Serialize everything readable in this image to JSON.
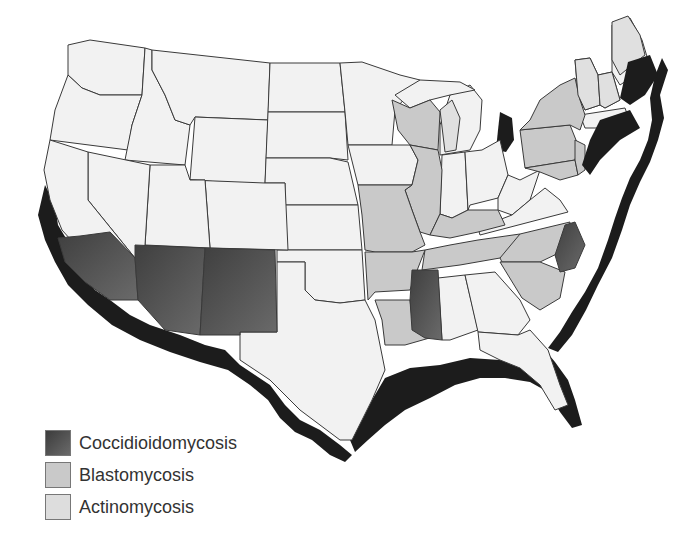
{
  "map": {
    "title": "",
    "region": "Contiguous United States",
    "colors": {
      "background": "#ffffff",
      "default_state": "#f2f2f2",
      "coccidioidomycosis": "#555555",
      "blastomycosis": "#c9c9c9",
      "actinomycosis": "#e0e0e0",
      "coastal_band": "#1a1a1a",
      "border": "#3a3a3a"
    },
    "states": {
      "coccidioidomycosis": [
        "Southern California",
        "Arizona",
        "New Mexico",
        "Mississippi",
        "North Carolina (eastern)"
      ],
      "blastomycosis": [
        "Wisconsin",
        "Illinois",
        "Missouri",
        "Arkansas",
        "Louisiana",
        "Kentucky",
        "Tennessee",
        "Pennsylvania",
        "New York",
        "South Carolina",
        "Maryland"
      ],
      "actinomycosis": [
        "Michigan (Upper Peninsula)",
        "Vermont",
        "New Hampshire",
        "Maine (north)"
      ]
    }
  },
  "legend": {
    "items": [
      {
        "label": "Coccidioidomycosis",
        "color": "#555555"
      },
      {
        "label": "Blastomycosis",
        "color": "#c9c9c9"
      },
      {
        "label": "Actinomycosis",
        "color": "#dddddd"
      }
    ]
  }
}
